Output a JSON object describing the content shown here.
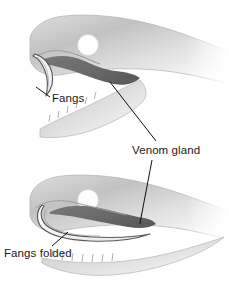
{
  "figure": {
    "kind": "anatomical-diagram",
    "background_color": "#ffffff"
  },
  "labels": {
    "fangs": "Fangs",
    "venom_gland": "Venom gland",
    "fangs_folded": "Fangs folded"
  },
  "panels": [
    {
      "id": "upper",
      "state": "fangs erect",
      "parts": [
        "head",
        "eye",
        "venom gland",
        "fang",
        "upper jaw",
        "lower jaw",
        "teeth"
      ]
    },
    {
      "id": "lower",
      "state": "fangs folded",
      "parts": [
        "head",
        "eye",
        "venom gland",
        "folded fang",
        "upper jaw",
        "lower jaw",
        "teeth"
      ]
    }
  ],
  "colors": {
    "background": "#ffffff",
    "head_light": "#f2f2f2",
    "head_mid": "#c9c9c9",
    "head_dark": "#a8a8a8",
    "gland": "#6e6e6e",
    "gland_dark": "#5a5a5a",
    "outline": "#8d8d8d",
    "fang_fill": "#fbfbfb",
    "fang_outline": "#5d5d5d",
    "leader_line": "#111111",
    "text": "#1a1a1a",
    "eye": "#ffffff"
  },
  "leader_lines": {
    "fangs": "from label up-left to fang tip",
    "venom_gland_upper": "from label up-left to upper panel gland tip",
    "venom_gland_lower": "from label down-left to lower panel gland tip",
    "fangs_folded": "from label up-right to folded fang"
  }
}
